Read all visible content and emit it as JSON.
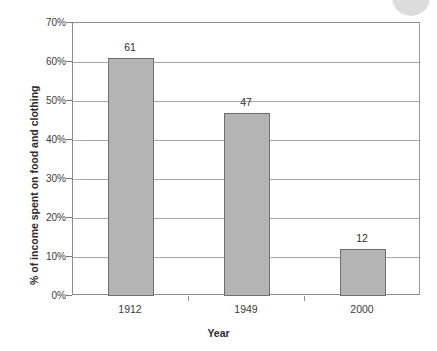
{
  "chart_data": {
    "type": "bar",
    "title": "",
    "xlabel": "Year",
    "ylabel": "% of income spent on food and clothing",
    "categories": [
      "1912",
      "1949",
      "2000"
    ],
    "values": [
      61,
      47,
      12
    ],
    "value_labels": [
      "61",
      "47",
      "12"
    ],
    "ylim": [
      0,
      70
    ],
    "ytick_values": [
      0,
      10,
      20,
      30,
      40,
      50,
      60,
      70
    ],
    "ytick_labels": [
      "0%",
      "10%",
      "20%",
      "30%",
      "40%",
      "50%",
      "60%",
      "70%"
    ],
    "grid": true,
    "legend": false,
    "bar_color": "#b4b4b4",
    "bar_border_color": "#6e6e6e",
    "gridline_color": "#a9a9a9",
    "axis_color": "#8c8c8c",
    "background": "#ffffff"
  }
}
